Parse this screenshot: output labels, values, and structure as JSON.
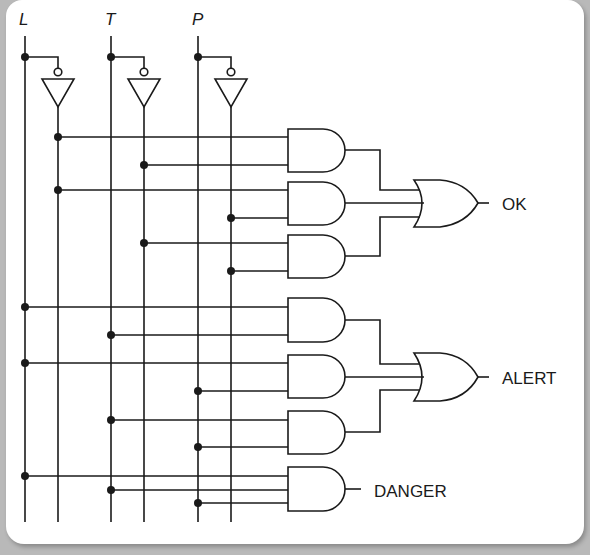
{
  "diagram": {
    "type": "logic-circuit",
    "inputs": [
      {
        "id": "L",
        "label": "L",
        "x": 25,
        "inv_x": 58
      },
      {
        "id": "T",
        "label": "T",
        "x": 111,
        "inv_x": 144
      },
      {
        "id": "P",
        "label": "P",
        "x": 198,
        "inv_x": 231
      }
    ],
    "outputs": {
      "ok": "OK",
      "alert": "ALERT",
      "danger": "DANGER"
    },
    "gates": [
      {
        "id": "and1",
        "type": "AND",
        "inputs": [
          "L'",
          "T'"
        ],
        "feeds": "OK"
      },
      {
        "id": "and2",
        "type": "AND",
        "inputs": [
          "L'",
          "P'"
        ],
        "feeds": "OK"
      },
      {
        "id": "and3",
        "type": "AND",
        "inputs": [
          "T'",
          "P'"
        ],
        "feeds": "OK"
      },
      {
        "id": "or_ok",
        "type": "OR",
        "inputs": [
          "and1",
          "and2",
          "and3"
        ],
        "output": "OK"
      },
      {
        "id": "and4",
        "type": "AND",
        "inputs": [
          "L",
          "T"
        ],
        "feeds": "ALERT"
      },
      {
        "id": "and5",
        "type": "AND",
        "inputs": [
          "L",
          "P"
        ],
        "feeds": "ALERT"
      },
      {
        "id": "and6",
        "type": "AND",
        "inputs": [
          "T",
          "P"
        ],
        "feeds": "ALERT"
      },
      {
        "id": "or_alert",
        "type": "OR",
        "inputs": [
          "and4",
          "and5",
          "and6"
        ],
        "output": "ALERT"
      },
      {
        "id": "and_danger",
        "type": "AND",
        "inputs": [
          "L",
          "T",
          "P"
        ],
        "output": "DANGER"
      }
    ],
    "colors": {
      "line": "#1a1a1a",
      "background": "#ffffff",
      "frame": "#b9b9b9"
    }
  }
}
